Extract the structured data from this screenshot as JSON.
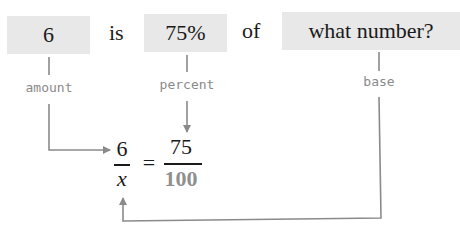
{
  "sentence": {
    "amount": "6",
    "is": "is",
    "percent": "75%",
    "of": "of",
    "base": "what number?"
  },
  "labels": {
    "amount": "amount",
    "percent": "percent",
    "base": "base"
  },
  "equation": {
    "left_numerator": "6",
    "left_denominator": "x",
    "equals": "=",
    "right_numerator": "75",
    "right_denominator": "100"
  },
  "colors": {
    "box_fill": "#e8e8e8",
    "line": "#8a8a8a",
    "label": "#8a8a8a",
    "text": "#1a1a1a"
  }
}
